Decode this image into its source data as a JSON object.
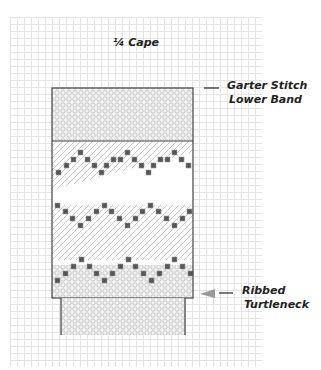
{
  "diagram": {
    "title": "¼ Cape",
    "labels": {
      "lower_band_line1": "Garter Stitch",
      "lower_band_line2": "Lower Band",
      "turtleneck_line1": "Ribbed",
      "turtleneck_line2": "Turtleneck"
    },
    "colors": {
      "outline": "#444444",
      "block": "#555555",
      "grid": "#e4e4e4",
      "arrow": "#999999"
    }
  }
}
